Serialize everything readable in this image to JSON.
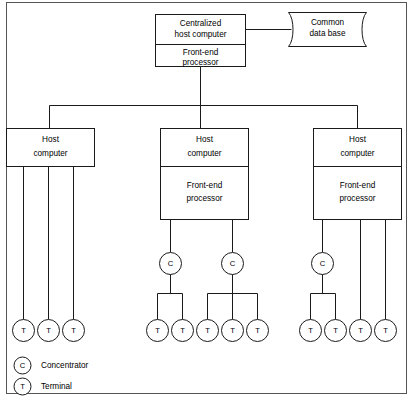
{
  "figure": {
    "background_color": "#ffffff",
    "line_color": "#1a1a1a",
    "frame_color": "#555555"
  },
  "nodes": {
    "centralized_host": {
      "line1": "Centralized",
      "line2": "host computer"
    },
    "root_front_end": {
      "line1": "Front-end",
      "line2": "processor"
    },
    "common_database": {
      "line1": "Common",
      "line2": "data base"
    },
    "host_left": {
      "line1": "Host",
      "line2": "computer"
    },
    "host_middle": {
      "line1": "Host",
      "line2": "computer"
    },
    "host_middle_front_end": {
      "line1": "Front-end",
      "line2": "processor"
    },
    "host_right": {
      "line1": "Host",
      "line2": "computer"
    },
    "host_right_front_end": {
      "line1": "Front-end",
      "line2": "processor"
    }
  },
  "symbols": {
    "concentrator": "C",
    "terminal": "T"
  },
  "legend": {
    "items": [
      {
        "symbol": "C",
        "label": "Concentrator",
        "icon": "concentrator-circle-icon"
      },
      {
        "symbol": "T",
        "label": "Terminal",
        "icon": "terminal-circle-icon"
      }
    ]
  },
  "counts": {
    "hosts": 3,
    "concentrators": 3,
    "terminals": 12,
    "terminals_left_host": 3,
    "terminals_middle_host": 5,
    "terminals_right_host": 4
  },
  "structure": {
    "left_host_drops": 3,
    "middle_host_concentrators": 2,
    "middle_concentrator_1_terminals": 2,
    "middle_concentrator_2_terminals": 3,
    "right_host_concentrators": 1,
    "right_concentrator_1_terminals": 2,
    "right_host_direct_terminals": 2
  }
}
